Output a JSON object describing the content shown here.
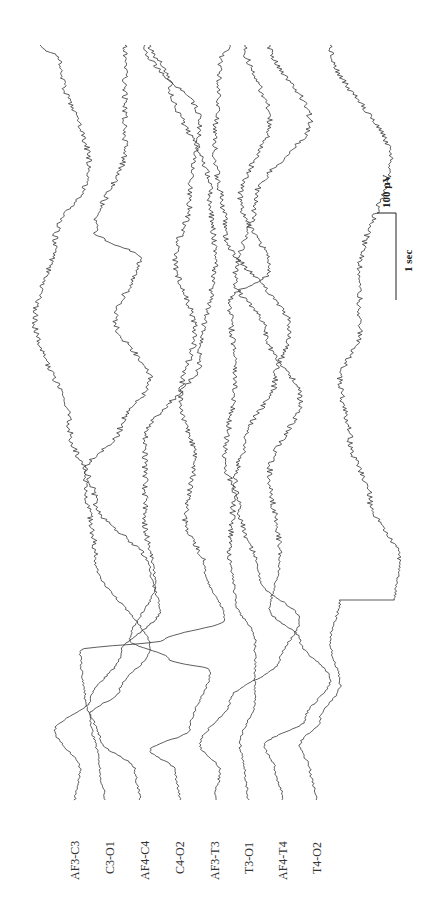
{
  "chart_data": {
    "type": "line",
    "title": "",
    "orientation": "rotated-90 (time runs bottom to top, amplitude left to right)",
    "xlabel": "time",
    "ylabel": "amplitude (µV)",
    "grid": false,
    "legend": "channel labels at start of each trace (bottom)",
    "scale_bar": {
      "amplitude_label": "100 µV",
      "time_label": "1 sec"
    },
    "channels": [
      "AF3-C3",
      "C3-O1",
      "AF4-C4",
      "C4-O2",
      "AF3-T3",
      "T3-O1",
      "AF4-T4",
      "T4-O2"
    ],
    "series": [
      {
        "name": "AF3-C3",
        "label_x": 75,
        "points": [
          [
            75,
            800
          ],
          [
            80,
            770
          ],
          [
            55,
            730
          ],
          [
            90,
            700
          ],
          [
            120,
            655
          ],
          [
            160,
            610
          ],
          [
            150,
            570
          ],
          [
            95,
            500
          ],
          [
            70,
            430
          ],
          [
            35,
            320
          ],
          [
            55,
            240
          ],
          [
            90,
            170
          ],
          [
            60,
            60
          ],
          [
            40,
            45
          ]
        ]
      },
      {
        "name": "C3-O1",
        "label_x": 110,
        "points": [
          [
            105,
            800
          ],
          [
            100,
            770
          ],
          [
            90,
            715
          ],
          [
            120,
            690
          ],
          [
            150,
            650
          ],
          [
            95,
            560
          ],
          [
            85,
            470
          ],
          [
            120,
            430
          ],
          [
            150,
            380
          ],
          [
            115,
            320
          ],
          [
            140,
            260
          ],
          [
            95,
            230
          ],
          [
            125,
            150
          ],
          [
            125,
            45
          ]
        ]
      },
      {
        "name": "AF4-C4",
        "label_x": 145,
        "points": [
          [
            140,
            800
          ],
          [
            135,
            770
          ],
          [
            100,
            740
          ],
          [
            85,
            700
          ],
          [
            80,
            650
          ],
          [
            165,
            640
          ],
          [
            225,
            620
          ],
          [
            205,
            570
          ],
          [
            185,
            520
          ],
          [
            195,
            460
          ],
          [
            180,
            400
          ],
          [
            195,
            330
          ],
          [
            175,
            260
          ],
          [
            190,
            200
          ],
          [
            200,
            120
          ],
          [
            145,
            45
          ]
        ]
      },
      {
        "name": "C4-O2",
        "label_x": 180,
        "points": [
          [
            180,
            800
          ],
          [
            175,
            770
          ],
          [
            150,
            750
          ],
          [
            190,
            730
          ],
          [
            210,
            670
          ],
          [
            170,
            660
          ],
          [
            130,
            640
          ],
          [
            155,
            585
          ],
          [
            145,
            520
          ],
          [
            145,
            440
          ],
          [
            200,
            360
          ],
          [
            215,
            260
          ],
          [
            210,
            190
          ],
          [
            170,
            80
          ],
          [
            150,
            45
          ]
        ]
      },
      {
        "name": "AF3-T3",
        "label_x": 215,
        "points": [
          [
            215,
            800
          ],
          [
            220,
            770
          ],
          [
            200,
            745
          ],
          [
            230,
            700
          ],
          [
            280,
            660
          ],
          [
            300,
            620
          ],
          [
            260,
            580
          ],
          [
            240,
            510
          ],
          [
            225,
            460
          ],
          [
            235,
            380
          ],
          [
            230,
            300
          ],
          [
            270,
            270
          ],
          [
            240,
            200
          ],
          [
            270,
            120
          ],
          [
            245,
            45
          ]
        ]
      },
      {
        "name": "T3-O1",
        "label_x": 248,
        "points": [
          [
            248,
            800
          ],
          [
            245,
            770
          ],
          [
            240,
            745
          ],
          [
            255,
            700
          ],
          [
            255,
            640
          ],
          [
            235,
            600
          ],
          [
            230,
            550
          ],
          [
            235,
            480
          ],
          [
            245,
            440
          ],
          [
            275,
            380
          ],
          [
            290,
            330
          ],
          [
            225,
            230
          ],
          [
            215,
            150
          ],
          [
            220,
            60
          ],
          [
            230,
            45
          ]
        ]
      },
      {
        "name": "AF4-T4",
        "label_x": 283,
        "points": [
          [
            283,
            800
          ],
          [
            275,
            770
          ],
          [
            265,
            745
          ],
          [
            305,
            720
          ],
          [
            330,
            680
          ],
          [
            300,
            640
          ],
          [
            270,
            610
          ],
          [
            280,
            560
          ],
          [
            270,
            470
          ],
          [
            300,
            400
          ],
          [
            265,
            330
          ],
          [
            235,
            280
          ],
          [
            255,
            200
          ],
          [
            310,
            120
          ],
          [
            270,
            45
          ]
        ]
      },
      {
        "name": "T4-O2",
        "label_x": 317,
        "points": [
          [
            317,
            800
          ],
          [
            310,
            770
          ],
          [
            300,
            745
          ],
          [
            320,
            720
          ],
          [
            340,
            685
          ],
          [
            330,
            640
          ],
          [
            340,
            600
          ],
          [
            395,
            600
          ],
          [
            400,
            560
          ],
          [
            370,
            500
          ],
          [
            350,
            440
          ],
          [
            340,
            380
          ],
          [
            360,
            330
          ],
          [
            360,
            270
          ],
          [
            390,
            160
          ],
          [
            330,
            45
          ]
        ]
      }
    ]
  },
  "labels": {
    "ch0": "AF3-C3",
    "ch1": "C3-O1",
    "ch2": "AF4-C4",
    "ch3": "C4-O2",
    "ch4": "AF3-T3",
    "ch5": "T3-O1",
    "ch6": "AF4-T4",
    "ch7": "T4-O2",
    "scale_amp": "100 µV",
    "scale_time": "1 sec"
  },
  "colors": {
    "trace": "#333333",
    "background": "#ffffff"
  }
}
